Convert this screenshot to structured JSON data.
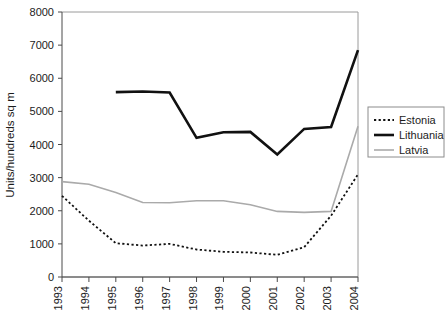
{
  "chart_data": {
    "type": "line",
    "title": "",
    "xlabel": "",
    "ylabel": "Units/hundreds sq m",
    "categories": [
      "1993",
      "1994",
      "1995",
      "1996",
      "1997",
      "1998",
      "1999",
      "2000",
      "2001",
      "2002",
      "2003",
      "2004"
    ],
    "x": [
      1993,
      1994,
      1995,
      1996,
      1997,
      1998,
      1999,
      2000,
      2001,
      2002,
      2003,
      2004
    ],
    "ylim": [
      0,
      8000
    ],
    "xlim": [
      1993,
      2004
    ],
    "ytick_labels": [
      "0",
      "1000",
      "2000",
      "3000",
      "4000",
      "5000",
      "6000",
      "7000",
      "8000"
    ],
    "ytick_values": [
      0,
      1000,
      2000,
      3000,
      4000,
      5000,
      6000,
      7000,
      8000
    ],
    "grid": false,
    "legend_position": "right",
    "series": [
      {
        "name": "Estonia",
        "style": "dashed",
        "color": "#111111",
        "width": 1.8,
        "values": [
          2450,
          1700,
          1020,
          950,
          1000,
          830,
          760,
          740,
          670,
          900,
          1850,
          3100
        ]
      },
      {
        "name": "Lithuania",
        "style": "solid",
        "color": "#111111",
        "width": 2.6,
        "values": [
          null,
          null,
          5580,
          5600,
          5570,
          4200,
          4370,
          4380,
          3700,
          4470,
          4530,
          6850
        ]
      },
      {
        "name": "Latvia",
        "style": "solid",
        "color": "#aaaaaa",
        "width": 1.6,
        "values": [
          2880,
          2800,
          2550,
          2250,
          2240,
          2300,
          2300,
          2180,
          1980,
          1950,
          1980,
          4550
        ]
      }
    ]
  },
  "legend": {
    "items": [
      {
        "label": "Estonia"
      },
      {
        "label": "Lithuania"
      },
      {
        "label": "Latvia"
      }
    ]
  }
}
